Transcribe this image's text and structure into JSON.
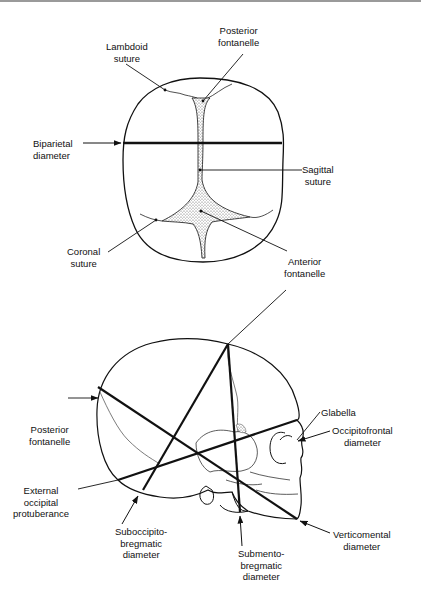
{
  "figure": {
    "type": "anatomical-diagram"
  },
  "top_view": {
    "labels": {
      "posterior_fontanelle": "Posterior\nfontanelle",
      "lambdoid_suture": "Lambdoid\nsuture",
      "biparietal_diameter": "Biparietal\ndiameter",
      "sagittal_suture": "Sagittal\nsuture",
      "coronal_suture": "Coronal\nsuture",
      "anterior_fontanelle": "Anterior\nfontanelle"
    }
  },
  "lateral_view": {
    "labels": {
      "glabella": "Glabella",
      "posterior_fontanelle": "Posterior\nfontanelle",
      "occipitofrontal_diameter": "Occipitofrontal\ndiameter",
      "external_occipital_protuberance": "External\noccipital\nprotuberance",
      "suboccipitobregmatic_diameter": "Suboccipito-\nbregmatic\ndiameter",
      "submentobregmatic_diameter": "Submento-\nbregmatic\ndiameter",
      "verticomental_diameter": "Verticomental\ndiameter"
    }
  },
  "colors": {
    "line": "#111111",
    "fontanelle_fill": "#cfcfcf",
    "background": "#ffffff"
  }
}
